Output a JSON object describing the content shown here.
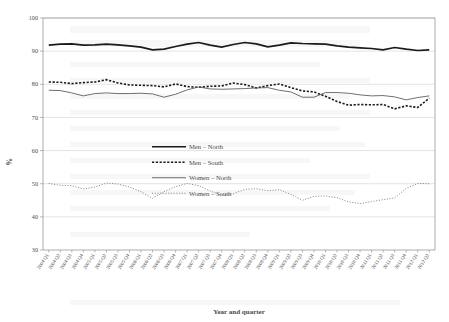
{
  "page": {
    "background_color": "#ffffff",
    "bleed_through_text": [
      "faint ghost text from reverse page",
      "showing through the paper"
    ]
  },
  "chart_data": {
    "type": "line",
    "title": "",
    "subtitle": "",
    "xlabel": "Year and quarter",
    "ylabel": "%",
    "ylim": [
      30,
      100
    ],
    "yticks": [
      30,
      40,
      50,
      60,
      70,
      80,
      90,
      100
    ],
    "grid": true,
    "grid_axis": "y",
    "legend_position": "center",
    "categories": [
      "2004 Q1",
      "2004 Q2",
      "2004 Q3",
      "2004 Q4",
      "2005 Q1",
      "2005 Q2",
      "2005 Q3",
      "2005 Q4",
      "2006 Q1",
      "2006 Q2",
      "2006 Q3",
      "2006 Q4",
      "2007 Q1",
      "2007 Q2",
      "2007 Q3",
      "2007 Q4",
      "2008 Q1",
      "2008 Q2",
      "2008 Q3",
      "2008 Q4",
      "2009 Q1",
      "2009 Q2",
      "2009 Q3",
      "2009 Q4",
      "2010 Q1",
      "2010 Q2",
      "2010 Q3",
      "2010 Q4",
      "2011 Q1",
      "2011 Q2",
      "2011 Q3",
      "2011 Q4",
      "2012 Q1",
      "2012 Q2"
    ],
    "series": [
      {
        "name": "Men – North",
        "style": "solid-thick",
        "color": "#1a1a1a",
        "values": [
          91.8,
          92.1,
          92.2,
          91.8,
          91.9,
          92.1,
          91.9,
          91.6,
          91.2,
          90.4,
          90.6,
          91.4,
          92.1,
          92.6,
          91.8,
          91.2,
          92.0,
          92.6,
          92.2,
          91.3,
          91.8,
          92.5,
          92.3,
          92.2,
          92.1,
          91.6,
          91.2,
          91.0,
          90.8,
          90.4,
          91.1,
          90.6,
          90.2,
          90.4
        ]
      },
      {
        "name": "Men – South",
        "style": "dashed-thick",
        "color": "#1a1a1a",
        "values": [
          80.7,
          80.6,
          80.2,
          80.5,
          80.7,
          81.4,
          80.4,
          79.8,
          79.7,
          79.6,
          79.2,
          80.1,
          79.3,
          79.1,
          79.4,
          79.5,
          80.4,
          79.9,
          78.9,
          79.6,
          80.1,
          79.0,
          78.0,
          77.7,
          76.4,
          74.8,
          73.7,
          73.9,
          73.8,
          73.9,
          72.6,
          73.5,
          73.0,
          75.8
        ]
      },
      {
        "name": "Women – North",
        "style": "solid-thin",
        "color": "#555555",
        "values": [
          78.2,
          78.1,
          77.4,
          76.5,
          77.2,
          77.4,
          77.2,
          77.2,
          77.3,
          77.1,
          76.1,
          77.0,
          78.3,
          79.2,
          78.6,
          78.5,
          78.6,
          78.7,
          78.9,
          79.0,
          78.2,
          77.7,
          76.1,
          76.1,
          77.5,
          77.5,
          77.3,
          76.8,
          76.5,
          76.6,
          76.2,
          75.3,
          76.0,
          76.5
        ]
      },
      {
        "name": "Women – South",
        "style": "dotted-thin",
        "color": "#777777",
        "values": [
          50.1,
          49.5,
          49.4,
          48.4,
          49.0,
          50.2,
          49.9,
          49.0,
          47.6,
          45.6,
          47.6,
          49.1,
          50.1,
          49.4,
          47.8,
          46.5,
          47.0,
          48.3,
          48.5,
          47.9,
          48.2,
          46.8,
          45.0,
          46.2,
          46.3,
          45.8,
          44.5,
          44.0,
          44.6,
          45.2,
          45.7,
          48.6,
          50.1,
          50.0
        ]
      }
    ]
  }
}
